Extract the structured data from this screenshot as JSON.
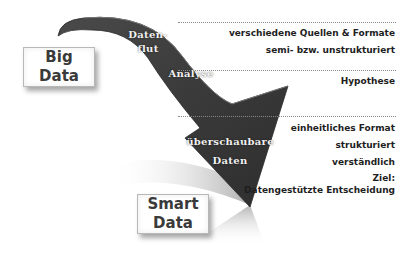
{
  "diagram": {
    "boxes": {
      "big_data": {
        "line1": "Big",
        "line2": "Data"
      },
      "smart_data": {
        "line1": "Smart",
        "line2": "Data"
      }
    },
    "arrow_labels": {
      "datenflut_line1": "Daten-",
      "datenflut_line2": "flut",
      "analyse": "Analyse",
      "ueberschaubare": "überschaubare",
      "daten": "Daten"
    },
    "right_column": {
      "group1": [
        "verschiedene Quellen & Formate",
        "semi- bzw. unstrukturiert"
      ],
      "group2": [
        "Hypothese"
      ],
      "group3": [
        "einheitliches Format",
        "strukturiert",
        "verständlich"
      ],
      "goal_label": "Ziel:",
      "goal_text": "Datengestützte Entscheidung"
    },
    "colors": {
      "arrow": "#3d3d3d",
      "arrow_highlight": "#6a6a6a",
      "text": "#1e1e1e",
      "divider": "#888888"
    }
  }
}
